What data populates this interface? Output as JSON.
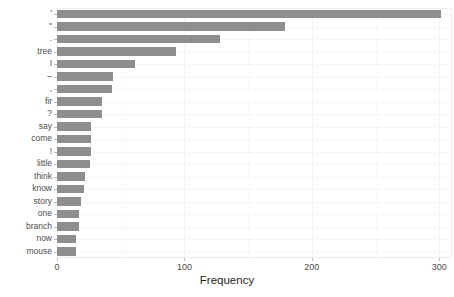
{
  "chart_data": {
    "type": "bar",
    "orientation": "horizontal",
    "title": "",
    "subtitle": "",
    "xlabel": "Frequency",
    "ylabel": "",
    "xlim": [
      0,
      310
    ],
    "ylim": null,
    "xticks": [
      0,
      100,
      200,
      300
    ],
    "xtick_labels": [
      "0",
      "100",
      "200",
      "300"
    ],
    "grid": true,
    "grid_axis": "both",
    "legend": null,
    "legend_position": "none",
    "bar_color": "#8e8e8e",
    "panel_background": "#ffffff",
    "gridline_color": "#f0f2f4",
    "axis_text_color": "#4d4d4d",
    "categories": [
      "'",
      "\"",
      ".",
      "tree",
      "I",
      "–",
      ",",
      "fir",
      "?",
      "say",
      "come",
      "!",
      "little",
      "think",
      "know",
      "story",
      "one",
      "branch",
      "now",
      "mouse"
    ],
    "values": [
      301,
      179,
      128,
      93,
      61,
      44,
      43,
      35,
      35,
      27,
      27,
      27,
      26,
      22,
      21,
      19,
      17,
      17,
      15,
      15
    ],
    "series": [
      {
        "name": "Frequency",
        "values": [
          301,
          179,
          128,
          93,
          61,
          44,
          43,
          35,
          35,
          27,
          27,
          27,
          26,
          22,
          21,
          19,
          17,
          17,
          15,
          15
        ]
      }
    ],
    "annotations": []
  },
  "axis": {
    "x_title": "Frequency"
  }
}
